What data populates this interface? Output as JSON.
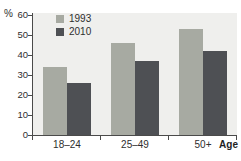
{
  "chart": {
    "percent_label": "%",
    "age_label": "Age",
    "colors": {
      "series_1993": "#a7aaa2",
      "series_2010": "#4e5054",
      "plot_background": "#efefed",
      "axis": "#4a4a4a",
      "text": "#2e2e2e"
    }
  },
  "chart_data": {
    "type": "bar",
    "title": "",
    "categories": [
      "18–24",
      "25–49",
      "50+"
    ],
    "series": [
      {
        "name": "1993",
        "color": "#a7aaa2",
        "values": [
          34,
          46,
          53
        ]
      },
      {
        "name": "2010",
        "color": "#4e5054",
        "values": [
          26,
          37,
          42
        ]
      }
    ],
    "xlabel": "Age",
    "ylabel": "%",
    "ylim": [
      0,
      60
    ],
    "y_ticks": [
      0,
      10,
      20,
      30,
      40,
      50,
      60
    ],
    "grid": false,
    "legend_position": "top-left"
  }
}
